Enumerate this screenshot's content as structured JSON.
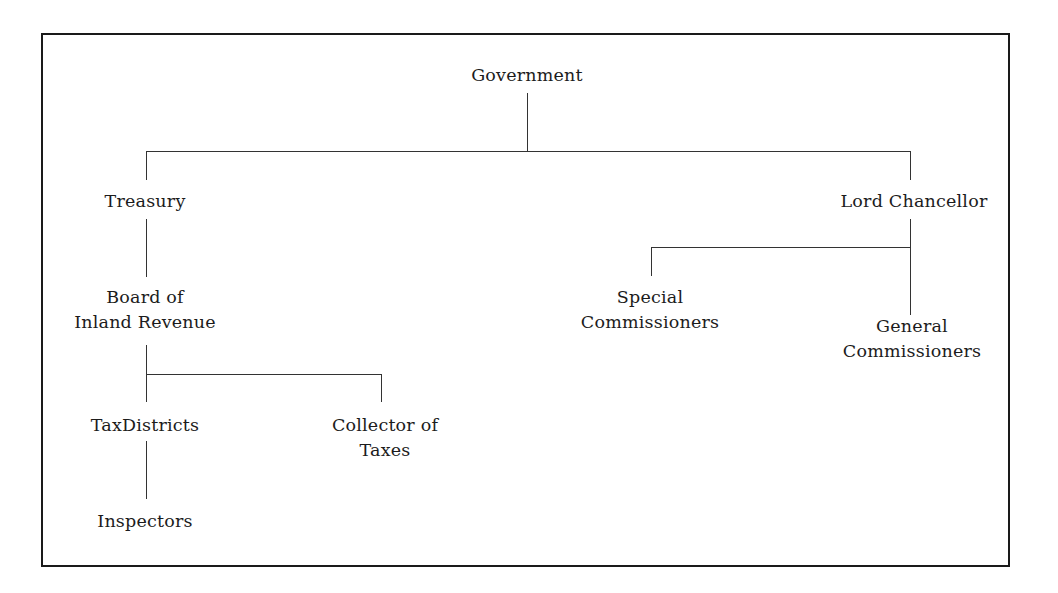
{
  "diagram": {
    "type": "organization-chart",
    "nodes": {
      "government": {
        "lines": [
          "Government"
        ]
      },
      "treasury": {
        "lines": [
          "Treasury"
        ]
      },
      "lord_chancellor": {
        "lines": [
          "Lord Chancellor"
        ]
      },
      "board_inland_revenue": {
        "lines": [
          "Board of",
          "Inland Revenue"
        ]
      },
      "special_commissioners": {
        "lines": [
          "Special",
          "Commissioners"
        ]
      },
      "general_commissioners": {
        "lines": [
          "General",
          "Commissioners"
        ]
      },
      "tax_districts": {
        "lines": [
          "TaxDistricts"
        ]
      },
      "collector_of_taxes": {
        "lines": [
          "Collector of",
          "Taxes"
        ]
      },
      "inspectors": {
        "lines": [
          "Inspectors"
        ]
      }
    },
    "edges": [
      [
        "Government",
        "Treasury"
      ],
      [
        "Government",
        "Lord Chancellor"
      ],
      [
        "Treasury",
        "Board of Inland Revenue"
      ],
      [
        "Lord Chancellor",
        "Special Commissioners"
      ],
      [
        "Lord Chancellor",
        "General Commissioners"
      ],
      [
        "Board of Inland Revenue",
        "TaxDistricts"
      ],
      [
        "Board of Inland Revenue",
        "Collector of Taxes"
      ],
      [
        "TaxDistricts",
        "Inspectors"
      ]
    ]
  }
}
